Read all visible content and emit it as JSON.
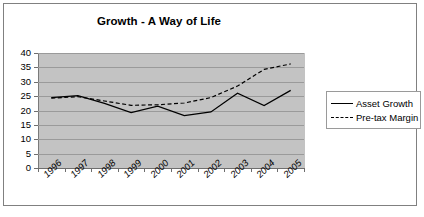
{
  "chart_data": {
    "type": "line",
    "title": "Growth - A Way of Life",
    "xlabel": "",
    "ylabel": "",
    "categories": [
      "1996",
      "1997",
      "1998",
      "1999",
      "2000",
      "2001",
      "2002",
      "2003",
      "2004",
      "2005"
    ],
    "series": [
      {
        "name": "Asset Growth",
        "style": "solid",
        "values": [
          24.5,
          25.2,
          22.5,
          19.3,
          21.5,
          18.2,
          19.5,
          26.0,
          21.7,
          27.0
        ]
      },
      {
        "name": "Pre-tax Margin",
        "style": "dashed",
        "values": [
          24.3,
          24.8,
          23.3,
          21.8,
          22.0,
          22.6,
          24.5,
          28.5,
          34.3,
          36.2
        ]
      }
    ],
    "ylim": [
      0,
      40
    ],
    "ytick_step": 5,
    "yticks": [
      "40",
      "35",
      "30",
      "25",
      "20",
      "15",
      "10",
      "5",
      "0"
    ],
    "grid": true,
    "legend_position": "right",
    "plot_background": "#c3c3c3",
    "line_color": "#000000",
    "frame_color": "#808080"
  },
  "legend": {
    "items": [
      {
        "label": "Asset Growth",
        "style": "solid"
      },
      {
        "label": "Pre-tax Margin",
        "style": "dashed"
      }
    ]
  }
}
